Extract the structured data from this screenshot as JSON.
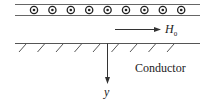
{
  "diagram": {
    "current_sheet": {
      "description": "current sheet with currents out of the page",
      "symbol_count": 9,
      "symbol": "dot-in-circle",
      "top_y": 4,
      "bottom_y": 15,
      "x_start": 15,
      "x_end": 200
    },
    "field": {
      "label_main": "H",
      "label_sub": "0",
      "direction": "right"
    },
    "conductor": {
      "label": "Conductor",
      "surface_y": 43
    },
    "axis": {
      "label": "y",
      "direction": "down"
    },
    "colors": {
      "line": "#333333",
      "sheet_line": "#555555",
      "text": "#222222"
    }
  }
}
